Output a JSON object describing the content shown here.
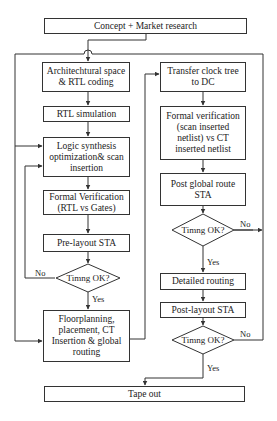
{
  "diagram": {
    "type": "flowchart",
    "nodes": {
      "concept": "Concept + Market research",
      "arch": "Architechtural space & RTL coding",
      "rtl_sim": "RTL simulation",
      "logic_syn": "Logic synthesis optimization& scan insertion",
      "formal_left": "Formal Verification (RTL vs Gates)",
      "pre_sta": "Pre-layout STA",
      "timing1": "Timng OK?",
      "floorplan": "Floorplanning, placement, CT Insertion & global routing",
      "transfer": "Transfer clock tree to DC",
      "formal_right": "Formal verification (scan inserted netlist) vs CT inserted netlist",
      "post_global": "Post global route STA",
      "timing2": "Timng OK?",
      "detailed": "Detailed routing",
      "post_sta": "Post-layout STA",
      "timing3": "Timng OK?",
      "tapeout": "Tape out"
    },
    "labels": {
      "no": "No",
      "yes": "Yes"
    },
    "edges": [
      {
        "from": "concept",
        "to": "arch"
      },
      {
        "from": "arch",
        "to": "rtl_sim"
      },
      {
        "from": "rtl_sim",
        "to": "logic_syn"
      },
      {
        "from": "logic_syn",
        "to": "formal_left"
      },
      {
        "from": "formal_left",
        "to": "pre_sta"
      },
      {
        "from": "pre_sta",
        "to": "timing1"
      },
      {
        "from": "timing1",
        "to": "logic_syn",
        "label": "No"
      },
      {
        "from": "timing1",
        "to": "floorplan",
        "label": "Yes"
      },
      {
        "from": "floorplan",
        "to": "transfer"
      },
      {
        "from": "transfer",
        "to": "formal_right"
      },
      {
        "from": "formal_right",
        "to": "post_global"
      },
      {
        "from": "post_global",
        "to": "timing2"
      },
      {
        "from": "timing2",
        "to": "floorplan",
        "label": "No"
      },
      {
        "from": "timing2",
        "to": "detailed",
        "label": "Yes"
      },
      {
        "from": "detailed",
        "to": "post_sta"
      },
      {
        "from": "post_sta",
        "to": "timing3"
      },
      {
        "from": "timing3",
        "to": "logic_syn",
        "label": "No"
      },
      {
        "from": "timing3",
        "to": "tapeout",
        "label": "Yes"
      }
    ]
  }
}
